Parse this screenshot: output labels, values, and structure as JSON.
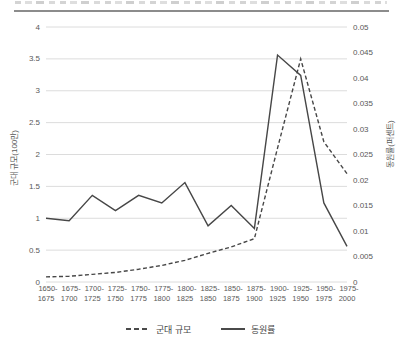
{
  "figure": {
    "top_rule_color": "#8c8c8c"
  },
  "chart_data": {
    "type": "line",
    "grid": true,
    "legend_position": "bottom",
    "categories": [
      "1650-1675",
      "1675-1700",
      "1700-1725",
      "1725-1750",
      "1750-1775",
      "1775-1800",
      "1800-1825",
      "1825-1850",
      "1850-1875",
      "1875-1900",
      "1900-1925",
      "1925-1950",
      "1950-1975",
      "1975-2000"
    ],
    "series": [
      {
        "name": "군대 규모",
        "axis": "left",
        "style": "dashed",
        "values": [
          0.08,
          0.09,
          0.12,
          0.15,
          0.2,
          0.26,
          0.34,
          0.45,
          0.55,
          0.68,
          2.1,
          3.5,
          2.2,
          1.7
        ]
      },
      {
        "name": "동원률",
        "axis": "right",
        "style": "solid",
        "values": [
          0.0125,
          0.012,
          0.017,
          0.014,
          0.017,
          0.0155,
          0.0195,
          0.011,
          0.015,
          0.0105,
          0.0445,
          0.0405,
          0.0155,
          0.007
        ]
      }
    ],
    "left_axis": {
      "label": "군대 규모(100만)",
      "min": 0,
      "max": 4,
      "ticks": [
        "0",
        "0.5",
        "1",
        "1.5",
        "2",
        "2.5",
        "3",
        "3.5",
        "4"
      ]
    },
    "right_axis": {
      "label": "동원률(퍼센트)",
      "min": 0,
      "max": 0.05,
      "ticks": [
        "0",
        "0.005",
        "0.01",
        "0.015",
        "0.02",
        "0.025",
        "0.03",
        "0.035",
        "0.04",
        "0.045",
        "0.05"
      ]
    },
    "legend": [
      {
        "label": "군대 규모",
        "style": "dashed"
      },
      {
        "label": "동원률",
        "style": "solid"
      }
    ],
    "colors": {
      "line": "#474747",
      "grid": "#dcdcdc",
      "text": "#595959",
      "rule": "#8c8c8c"
    }
  }
}
